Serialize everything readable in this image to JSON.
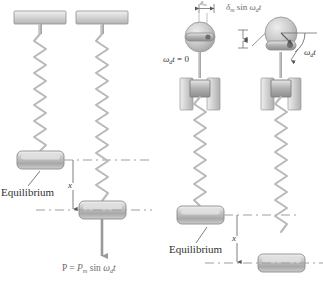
{
  "figure": {
    "colors": {
      "body_fill_light": "#e8e8e8",
      "body_fill_mid": "#c4c4c4",
      "body_fill_dark": "#9a9a9a",
      "outline": "#8c8c8c",
      "spring": "#b8b8b8",
      "dashed": "#9f9f9f",
      "text": "#3a3a3a",
      "text_muted": "#6b6b6b",
      "background": "#ffffff"
    }
  },
  "left_panel": {
    "name": "spring-mass-driven-by-force",
    "equilibrium_label": "Equilibrium",
    "displacement_label": "x",
    "force_label_parts": {
      "p": "P",
      "equals": "=",
      "amplitude": "P",
      "amplitude_sub": "m",
      "sin": "sin",
      "omega": "ω",
      "omega_sub": "d",
      "time": "t"
    },
    "force_label_plain": "P = Pm sin ωd t",
    "ceiling_supports": 2,
    "springs": 2,
    "masses": 2
  },
  "right_panel": {
    "name": "spring-mass-driven-by-slider",
    "equilibrium_label": "Equilibrium",
    "displacement_label": "x",
    "phase_zero_parts": {
      "omega": "ω",
      "omega_sub": "d",
      "time": "t",
      "equals": "= 0"
    },
    "phase_zero_plain": "ωd t = 0",
    "phase_angle_parts": {
      "omega": "ω",
      "omega_sub": "d",
      "time": "t"
    },
    "phase_angle_plain": "ωd t",
    "amplitude_parts": {
      "delta": "δ",
      "delta_sub": "m",
      "sin": "sin",
      "omega": "ω",
      "omega_sub": "d",
      "time": "t"
    },
    "amplitude_plain": "δm sin ωd t",
    "amplitude_marker": {
      "delta": "δ",
      "delta_sub": "m"
    },
    "discs": 2,
    "sliders": 2,
    "springs": 2,
    "masses": 2
  }
}
